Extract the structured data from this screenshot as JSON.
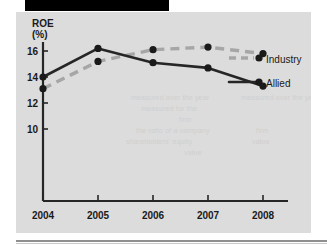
{
  "figure": {
    "panel_bg": "#dcdcdc",
    "banner_color": "#000000",
    "ink_color": "#262626",
    "industry_color": "#a6a6a6"
  },
  "axis": {
    "y_title": "ROE",
    "y_unit": "(%)",
    "y_ticks": [
      "16",
      "14",
      "12",
      "10"
    ],
    "x_ticks": [
      "2004",
      "2005",
      "2006",
      "2007",
      "2008"
    ]
  },
  "legend": {
    "industry_label": "Industry",
    "allied_label": "Allied"
  },
  "ghost_text": [
    "measured over the year",
    "measured for the",
    "firm",
    "the ratio of a company",
    "shareholders' equity",
    "value"
  ],
  "chart_data": {
    "type": "line",
    "title": "",
    "xlabel": "",
    "ylabel": "ROE (%)",
    "categories": [
      "2004",
      "2005",
      "2006",
      "2007",
      "2008"
    ],
    "x": [
      2004,
      2005,
      2006,
      2007,
      2008
    ],
    "ylim": [
      8,
      17
    ],
    "xlim": [
      2003.6,
      2008.9
    ],
    "y_ticks": [
      16,
      14,
      12,
      10
    ],
    "grid": false,
    "legend_position": "right-inline",
    "series": [
      {
        "name": "Allied",
        "style": "solid",
        "color": "#262626",
        "marker": "circle",
        "values": [
          14.0,
          16.2,
          15.1,
          14.7,
          13.3
        ]
      },
      {
        "name": "Industry",
        "style": "dashed",
        "color": "#a6a6a6",
        "marker": "circle",
        "values": [
          13.1,
          15.2,
          16.1,
          16.3,
          15.8
        ]
      }
    ]
  }
}
